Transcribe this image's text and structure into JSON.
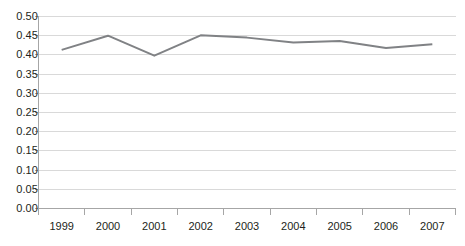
{
  "chart_data": {
    "type": "line",
    "title": "",
    "subtitle": "",
    "xlabel": "",
    "ylabel": "",
    "categories": [
      "1999",
      "2000",
      "2001",
      "2002",
      "2003",
      "2004",
      "2005",
      "2006",
      "2007"
    ],
    "series": [
      {
        "name": "series-1",
        "values": [
          0.413,
          0.45,
          0.398,
          0.451,
          0.445,
          0.432,
          0.436,
          0.418,
          0.428
        ],
        "color": "#808285",
        "line_width": 2
      }
    ],
    "ylim": [
      0.0,
      0.5
    ],
    "ytick_labels": [
      "0.50",
      "0.45",
      "0.40",
      "0.35",
      "0.30",
      "0.25",
      "0.20",
      "0.15",
      "0.10",
      "0.05",
      "0.00"
    ],
    "ytick_values": [
      0.5,
      0.45,
      0.4,
      0.35,
      0.3,
      0.25,
      0.2,
      0.15,
      0.1,
      0.05,
      0.0
    ],
    "grid": true,
    "grid_axis": "y",
    "grid_color": "#d9d9d9",
    "axis_color": "#a6a6a6",
    "legend": false,
    "legend_position": "none",
    "markers": false,
    "background_color": "#ffffff",
    "text_color": "#231f20",
    "annotations": []
  },
  "axes": {
    "y": {
      "ticks": [
        {
          "label": "0.50",
          "value": 0.5
        },
        {
          "label": "0.45",
          "value": 0.45
        },
        {
          "label": "0.40",
          "value": 0.4
        },
        {
          "label": "0.35",
          "value": 0.35
        },
        {
          "label": "0.30",
          "value": 0.3
        },
        {
          "label": "0.25",
          "value": 0.25
        },
        {
          "label": "0.20",
          "value": 0.2
        },
        {
          "label": "0.15",
          "value": 0.15
        },
        {
          "label": "0.10",
          "value": 0.1
        },
        {
          "label": "0.05",
          "value": 0.05
        },
        {
          "label": "0.00",
          "value": 0.0
        }
      ]
    },
    "x": {
      "ticks": [
        {
          "label": "1999"
        },
        {
          "label": "2000"
        },
        {
          "label": "2001"
        },
        {
          "label": "2002"
        },
        {
          "label": "2003"
        },
        {
          "label": "2004"
        },
        {
          "label": "2005"
        },
        {
          "label": "2006"
        },
        {
          "label": "2007"
        }
      ]
    }
  }
}
